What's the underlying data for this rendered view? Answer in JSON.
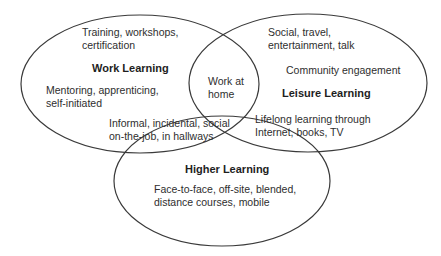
{
  "diagram": {
    "type": "venn",
    "colors": {
      "outline": "#3a3a3a",
      "overlap_outline": "#8a8a8a",
      "text": "#2e2e2e",
      "background": "#ffffff"
    },
    "sets": [
      {
        "id": "work",
        "title": "Work Learning",
        "notes": [
          [
            "Training, workshops,",
            "certification"
          ],
          [
            "Mentoring, apprenticing,",
            "self-initiated"
          ]
        ]
      },
      {
        "id": "leisure",
        "title": "Leisure Learning",
        "notes": [
          [
            "Social, travel,",
            "entertainment, talk"
          ],
          [
            "Community engagement"
          ]
        ]
      },
      {
        "id": "higher",
        "title": "Higher Learning",
        "notes": [
          [
            "Face-to-face, off-site, blended,",
            "distance courses, mobile"
          ]
        ]
      }
    ],
    "intersections": {
      "work_leisure": [
        "Work at",
        "home"
      ],
      "work_higher": [
        "Informal, incidental, social",
        "on-the-job, in hallways"
      ],
      "leisure_higher": [
        "Lifelong learning through",
        "Internet, books, TV"
      ]
    }
  }
}
